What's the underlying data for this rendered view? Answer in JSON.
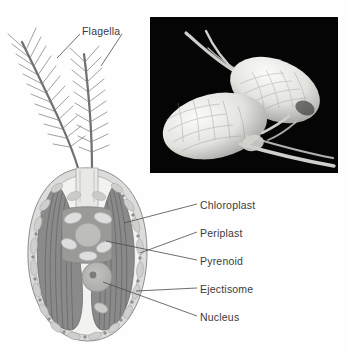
{
  "figure": {
    "background_color": "#fefefe"
  },
  "labels": {
    "flagella": "Flagella",
    "chloroplast": "Chloroplast",
    "periplast": "Periplast",
    "pyrenoid": "Pyrenoid",
    "ejectisome": "Ejectisome",
    "nucleus": "Nucleus"
  },
  "colors": {
    "text": "#3b3b3b",
    "leader_line": "#4a4a4a",
    "cell_outline": "#8e8e8e",
    "cytoplasm": "#f2f2f0",
    "periplast_band": "#dcdcda",
    "chloroplast": "#8a8a8a",
    "chloroplast_stripe": "#6e6e6e",
    "pyrenoid": "#b9b9b7",
    "pyrenoid_matrix": "#9a9a98",
    "starch_grain": "#dedede",
    "nucleus": "#b0b0ae",
    "nucleolus": "#7c7c7a",
    "ejectisome": "#cfcfcd",
    "ejectisome_dot": "#8f8f8d",
    "flagellum": "#7d7d7d",
    "photo_background": "#050505",
    "photo_cell": "#e9e9e7"
  },
  "micrograph": {
    "type": "scanning-electron-micrograph",
    "background": "black",
    "subject": "two scale-covered cryptomonad cells with flagella",
    "cell_count": 2,
    "bounds": {
      "x": 150,
      "y": 17,
      "width": 188,
      "height": 156
    }
  },
  "diagram": {
    "organelles": [
      "flagella",
      "chloroplast",
      "periplast",
      "pyrenoid",
      "ejectisome",
      "nucleus"
    ]
  }
}
